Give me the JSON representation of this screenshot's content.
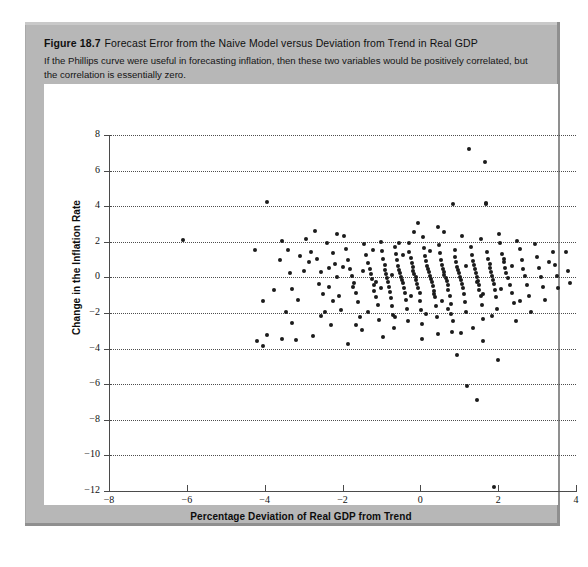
{
  "figure": {
    "number": "Figure 18.7",
    "title": "Forecast Error from the Naive Model versus Deviation from Trend in Real GDP",
    "caption": "If the Phillips curve were useful in forecasting inflation, then these two variables would be positively correlated, but the correlation is essentially zero."
  },
  "colors": {
    "panel": "#b7b7b7",
    "plot_background": "#ffffff",
    "marker": "#1b1b1b",
    "axis": "#4a4a4a",
    "grid": "#4d4d4d"
  },
  "chart_data": {
    "type": "scatter",
    "title": "Forecast Error from the Naive Model versus Deviation from Trend in Real GDP",
    "xlabel": "Percentage Deviation of Real GDP from Trend",
    "ylabel": "Change in the Inflation Rate",
    "xlim": [
      -8,
      4
    ],
    "ylim": [
      -12,
      8
    ],
    "xticks": [
      -8,
      -6,
      -4,
      -2,
      0,
      2,
      4
    ],
    "yticks": [
      8,
      6,
      4,
      2,
      0,
      -2,
      -4,
      -6,
      -8,
      -10,
      -12
    ],
    "grid": "horizontal-dotted",
    "legend": "none",
    "annotations": [],
    "points": [
      [
        -6.1,
        2.1
      ],
      [
        -3.95,
        4.25
      ],
      [
        -3.55,
        2.05
      ],
      [
        -3.4,
        1.55
      ],
      [
        -3.1,
        1.2
      ],
      [
        -3.35,
        0.25
      ],
      [
        -3.0,
        0.35
      ],
      [
        -3.3,
        -0.65
      ],
      [
        -3.75,
        -0.7
      ],
      [
        -3.45,
        -1.95
      ],
      [
        -3.3,
        -2.55
      ],
      [
        -3.55,
        -3.45
      ],
      [
        -3.2,
        -3.5
      ],
      [
        -3.95,
        -3.25
      ],
      [
        -2.8,
        1.45
      ],
      [
        -2.7,
        2.6
      ],
      [
        -2.55,
        0.3
      ],
      [
        -2.6,
        -0.35
      ],
      [
        -2.45,
        -1.95
      ],
      [
        -2.3,
        -2.7
      ],
      [
        -2.75,
        -3.3
      ],
      [
        -2.4,
        1.95
      ],
      [
        -2.25,
        1.35
      ],
      [
        -2.2,
        0.75
      ],
      [
        -2.15,
        0.05
      ],
      [
        -2.35,
        -0.55
      ],
      [
        -2.1,
        -1.05
      ],
      [
        -2.05,
        -1.85
      ],
      [
        -1.95,
        2.35
      ],
      [
        -1.9,
        1.6
      ],
      [
        -1.85,
        0.95
      ],
      [
        -1.8,
        0.45
      ],
      [
        -1.75,
        0.1
      ],
      [
        -1.7,
        -0.3
      ],
      [
        -1.65,
        -0.85
      ],
      [
        -1.6,
        -1.4
      ],
      [
        -1.55,
        -2.2
      ],
      [
        -1.5,
        -2.95
      ],
      [
        -1.45,
        1.85
      ],
      [
        -1.4,
        1.25
      ],
      [
        -1.35,
        0.8
      ],
      [
        -1.3,
        0.5
      ],
      [
        -1.28,
        0.2
      ],
      [
        -1.25,
        -0.1
      ],
      [
        -1.2,
        -0.4
      ],
      [
        -1.18,
        -0.75
      ],
      [
        -1.15,
        -1.1
      ],
      [
        -1.1,
        -1.55
      ],
      [
        -1.05,
        -2.4
      ],
      [
        -1.0,
        2.0
      ],
      [
        -0.98,
        1.5
      ],
      [
        -0.95,
        1.05
      ],
      [
        -0.92,
        0.7
      ],
      [
        -0.9,
        0.42
      ],
      [
        -0.88,
        0.18
      ],
      [
        -0.85,
        -0.05
      ],
      [
        -0.82,
        -0.28
      ],
      [
        -0.8,
        -0.52
      ],
      [
        -0.78,
        -0.8
      ],
      [
        -0.75,
        -1.15
      ],
      [
        -0.72,
        -1.6
      ],
      [
        -0.7,
        -2.1
      ],
      [
        -0.68,
        -2.85
      ],
      [
        -0.65,
        1.7
      ],
      [
        -0.62,
        1.3
      ],
      [
        -0.6,
        0.95
      ],
      [
        -0.58,
        0.65
      ],
      [
        -0.55,
        0.4
      ],
      [
        -0.52,
        0.22
      ],
      [
        -0.5,
        0.05
      ],
      [
        -0.48,
        -0.12
      ],
      [
        -0.45,
        -0.32
      ],
      [
        -0.42,
        -0.58
      ],
      [
        -0.4,
        -0.88
      ],
      [
        -0.38,
        -1.25
      ],
      [
        -0.35,
        -1.75
      ],
      [
        -0.32,
        -2.45
      ],
      [
        -0.3,
        1.95
      ],
      [
        -0.28,
        1.45
      ],
      [
        -0.25,
        1.1
      ],
      [
        -0.22,
        0.82
      ],
      [
        -0.2,
        0.58
      ],
      [
        -0.18,
        0.38
      ],
      [
        -0.15,
        0.2
      ],
      [
        -0.12,
        0.02
      ],
      [
        -0.1,
        -0.15
      ],
      [
        -0.08,
        -0.35
      ],
      [
        -0.05,
        -0.6
      ],
      [
        -0.02,
        -0.9
      ],
      [
        0.0,
        -1.3
      ],
      [
        0.02,
        -1.85
      ],
      [
        0.05,
        -2.6
      ],
      [
        0.08,
        2.25
      ],
      [
        0.1,
        1.65
      ],
      [
        0.12,
        1.22
      ],
      [
        0.15,
        0.9
      ],
      [
        0.18,
        0.65
      ],
      [
        0.2,
        0.45
      ],
      [
        0.22,
        0.28
      ],
      [
        0.25,
        0.1
      ],
      [
        0.28,
        -0.08
      ],
      [
        0.3,
        -0.28
      ],
      [
        0.32,
        -0.5
      ],
      [
        0.35,
        -0.78
      ],
      [
        0.38,
        -1.12
      ],
      [
        0.4,
        -1.58
      ],
      [
        0.42,
        -2.2
      ],
      [
        0.45,
        -3.2
      ],
      [
        0.48,
        1.8
      ],
      [
        0.5,
        1.35
      ],
      [
        0.52,
        1.0
      ],
      [
        0.55,
        0.72
      ],
      [
        0.58,
        0.5
      ],
      [
        0.6,
        0.32
      ],
      [
        0.62,
        0.15
      ],
      [
        0.65,
        -0.02
      ],
      [
        0.68,
        -0.22
      ],
      [
        0.7,
        -0.45
      ],
      [
        0.72,
        -0.72
      ],
      [
        0.75,
        -1.05
      ],
      [
        0.78,
        -1.48
      ],
      [
        0.8,
        -2.05
      ],
      [
        0.82,
        -3.05
      ],
      [
        0.85,
        4.15
      ],
      [
        0.88,
        1.55
      ],
      [
        0.9,
        1.15
      ],
      [
        0.92,
        0.85
      ],
      [
        0.95,
        0.6
      ],
      [
        0.98,
        0.4
      ],
      [
        1.0,
        0.22
      ],
      [
        1.02,
        0.05
      ],
      [
        1.05,
        -0.15
      ],
      [
        1.08,
        -0.38
      ],
      [
        1.1,
        -0.62
      ],
      [
        1.12,
        -0.95
      ],
      [
        1.15,
        -1.38
      ],
      [
        1.18,
        -1.95
      ],
      [
        1.2,
        -6.1
      ],
      [
        1.25,
        7.2
      ],
      [
        1.3,
        1.7
      ],
      [
        1.32,
        1.25
      ],
      [
        1.35,
        0.92
      ],
      [
        1.38,
        0.68
      ],
      [
        1.4,
        0.45
      ],
      [
        1.42,
        0.25
      ],
      [
        1.45,
        0.05
      ],
      [
        1.48,
        -0.18
      ],
      [
        1.5,
        -0.42
      ],
      [
        1.52,
        -0.7
      ],
      [
        1.55,
        -1.05
      ],
      [
        1.58,
        -1.55
      ],
      [
        1.6,
        -2.35
      ],
      [
        1.62,
        -3.55
      ],
      [
        1.65,
        6.5
      ],
      [
        1.68,
        4.2
      ],
      [
        1.7,
        4.1
      ],
      [
        1.72,
        1.45
      ],
      [
        1.75,
        1.05
      ],
      [
        1.78,
        0.78
      ],
      [
        1.8,
        0.55
      ],
      [
        1.82,
        0.32
      ],
      [
        1.85,
        0.1
      ],
      [
        1.88,
        -0.12
      ],
      [
        1.9,
        -0.38
      ],
      [
        1.92,
        -0.68
      ],
      [
        1.95,
        -1.1
      ],
      [
        1.98,
        -1.75
      ],
      [
        2.0,
        -4.65
      ],
      [
        1.9,
        -11.8
      ],
      [
        1.45,
        -6.9
      ],
      [
        2.05,
        1.95
      ],
      [
        2.1,
        1.3
      ],
      [
        2.15,
        0.88
      ],
      [
        2.18,
        0.55
      ],
      [
        2.2,
        0.25
      ],
      [
        2.25,
        -0.05
      ],
      [
        2.3,
        -0.4
      ],
      [
        2.35,
        -0.85
      ],
      [
        2.4,
        -1.45
      ],
      [
        2.45,
        -2.45
      ],
      [
        2.55,
        1.6
      ],
      [
        2.6,
        0.95
      ],
      [
        2.65,
        0.48
      ],
      [
        2.7,
        0.08
      ],
      [
        2.75,
        -0.45
      ],
      [
        2.8,
        -1.05
      ],
      [
        2.85,
        -1.95
      ],
      [
        2.95,
        1.85
      ],
      [
        3.0,
        1.15
      ],
      [
        3.05,
        0.55
      ],
      [
        3.1,
        0.05
      ],
      [
        3.15,
        -0.55
      ],
      [
        3.2,
        -1.25
      ],
      [
        3.4,
        1.45
      ],
      [
        3.45,
        0.7
      ],
      [
        3.5,
        0.1
      ],
      [
        3.55,
        -0.6
      ],
      [
        3.75,
        1.4
      ],
      [
        3.8,
        0.35
      ],
      [
        3.85,
        -0.3
      ],
      [
        -4.25,
        1.55
      ],
      [
        -4.05,
        -1.35
      ],
      [
        -4.2,
        -3.6
      ],
      [
        -4.05,
        -3.85
      ],
      [
        -2.95,
        2.15
      ],
      [
        -2.5,
        -0.95
      ],
      [
        -2.0,
        0.6
      ],
      [
        -1.48,
        0.35
      ],
      [
        -1.02,
        -0.62
      ],
      [
        -0.55,
        1.95
      ],
      [
        0.15,
        -2.05
      ],
      [
        0.62,
        2.55
      ],
      [
        1.08,
        2.35
      ],
      [
        1.55,
        2.15
      ],
      [
        2.02,
        2.45
      ],
      [
        2.48,
        2.05
      ],
      [
        -2.85,
        0.85
      ],
      [
        -2.25,
        -1.35
      ],
      [
        -1.72,
        -0.55
      ],
      [
        -1.22,
        1.55
      ],
      [
        -0.72,
        0.15
      ],
      [
        -0.25,
        -1.05
      ],
      [
        0.25,
        1.5
      ],
      [
        0.72,
        -1.75
      ],
      [
        1.18,
        0.62
      ],
      [
        1.62,
        -0.95
      ],
      [
        2.08,
        -0.65
      ],
      [
        2.55,
        -1.35
      ],
      [
        -3.15,
        -1.25
      ],
      [
        -2.65,
        1.05
      ],
      [
        -2.15,
        2.45
      ],
      [
        -1.65,
        -2.65
      ],
      [
        -1.15,
        -0.25
      ],
      [
        -0.65,
        -2.25
      ],
      [
        -0.15,
        2.55
      ],
      [
        0.35,
        -0.95
      ],
      [
        0.85,
        -2.45
      ],
      [
        1.35,
        -2.85
      ],
      [
        1.85,
        -2.15
      ],
      [
        2.35,
        0.62
      ],
      [
        -3.6,
        0.95
      ],
      [
        -2.35,
        0.55
      ],
      [
        -1.35,
        -1.95
      ],
      [
        -0.45,
        1.25
      ],
      [
        0.55,
        -1.35
      ],
      [
        1.45,
        -0.25
      ],
      [
        2.15,
        1.05
      ],
      [
        3.3,
        0.85
      ],
      [
        -0.95,
        -3.35
      ],
      [
        0.05,
        -3.45
      ],
      [
        1.05,
        -3.15
      ],
      [
        -1.85,
        -3.75
      ],
      [
        0.95,
        -4.35
      ],
      [
        -2.55,
        -2.15
      ],
      [
        -0.05,
        3.05
      ],
      [
        0.45,
        2.85
      ]
    ]
  }
}
